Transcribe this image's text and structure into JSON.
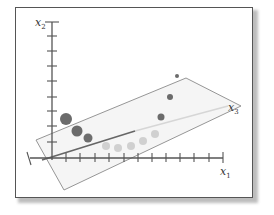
{
  "diagram": {
    "axes": {
      "x1": {
        "label": "x",
        "subscript": "1"
      },
      "x2": {
        "label": "x",
        "subscript": "2"
      },
      "x3": {
        "label": "x",
        "subscript": "3"
      }
    },
    "colors": {
      "frame": "#555555",
      "axis": "#555555",
      "plane": "#8a8a8a",
      "plane_fill": "#f4f4f4",
      "dark_point": "#6b6b6b",
      "light_point": "#cfcfcf",
      "x3_dark": "#666666",
      "x3_light": "#d8d8d8"
    },
    "points": [
      {
        "cx": 66,
        "cy": 119,
        "r": 6,
        "shade": "dark"
      },
      {
        "cx": 77,
        "cy": 131,
        "r": 5.5,
        "shade": "dark"
      },
      {
        "cx": 88,
        "cy": 138,
        "r": 4.5,
        "shade": "dark"
      },
      {
        "cx": 106,
        "cy": 146,
        "r": 4,
        "shade": "light"
      },
      {
        "cx": 118,
        "cy": 148,
        "r": 4,
        "shade": "light"
      },
      {
        "cx": 131,
        "cy": 146,
        "r": 4,
        "shade": "light"
      },
      {
        "cx": 143,
        "cy": 141,
        "r": 4,
        "shade": "light"
      },
      {
        "cx": 155,
        "cy": 134,
        "r": 4,
        "shade": "light"
      },
      {
        "cx": 161,
        "cy": 117,
        "r": 3.5,
        "shade": "dark"
      },
      {
        "cx": 170,
        "cy": 97,
        "r": 3,
        "shade": "dark"
      },
      {
        "cx": 177,
        "cy": 76,
        "r": 2,
        "shade": "dark"
      }
    ]
  }
}
